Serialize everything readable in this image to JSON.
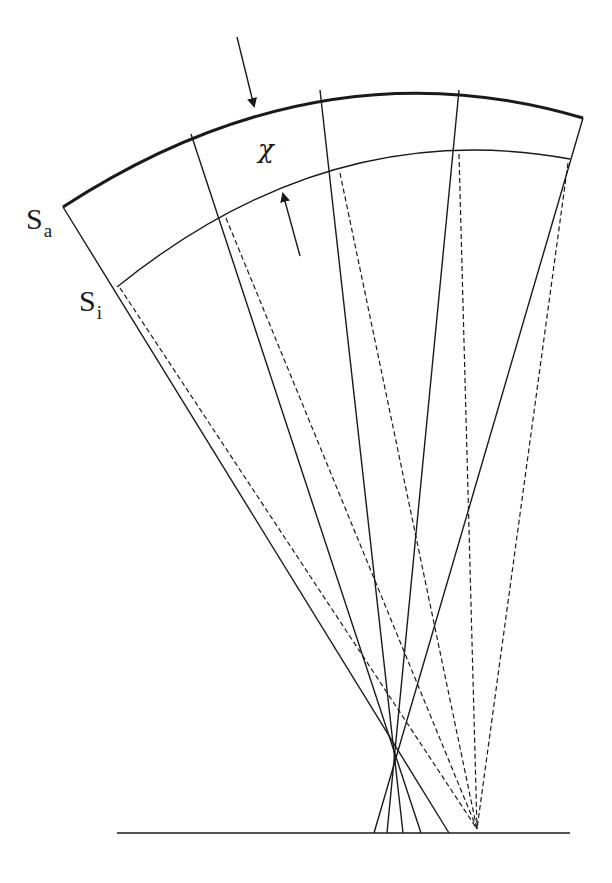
{
  "labels": {
    "outer_surface": {
      "main": "S",
      "sub": "a"
    },
    "inner_surface": {
      "main": "S",
      "sub": "i"
    },
    "thickness": "χ"
  },
  "colors": {
    "stroke": "#1a1a1a",
    "background": "#ffffff"
  },
  "geometry": {
    "outer_arc": {
      "start": [
        63,
        207
      ],
      "end": [
        583,
        118
      ],
      "control": [
        320,
        40
      ],
      "stroke_width": 3
    },
    "inner_arc": {
      "start": [
        117,
        287
      ],
      "end": [
        570,
        159
      ],
      "control": [
        330,
        115
      ],
      "stroke_width": 1.4
    },
    "baseline": {
      "x1": 117,
      "x2": 570,
      "y": 833
    },
    "solid_rays": [
      {
        "from": [
          63,
          207
        ],
        "to": [
          449,
          833
        ]
      },
      {
        "from": [
          191,
          134
        ],
        "to": [
          421,
          833
        ]
      },
      {
        "from": [
          320,
          90
        ],
        "to": [
          403,
          833
        ]
      },
      {
        "from": [
          459,
          90
        ],
        "to": [
          387,
          833
        ]
      },
      {
        "from": [
          583,
          118
        ],
        "to": [
          374,
          833
        ]
      }
    ],
    "dashed_rays": [
      {
        "from": [
          120,
          288
        ],
        "to": [
          477,
          829
        ]
      },
      {
        "from": [
          226,
          218
        ],
        "to": [
          477,
          829
        ]
      },
      {
        "from": [
          340,
          173
        ],
        "to": [
          477,
          829
        ]
      },
      {
        "from": [
          459,
          154
        ],
        "to": [
          477,
          829
        ]
      },
      {
        "from": [
          568,
          163
        ],
        "to": [
          477,
          829
        ]
      }
    ],
    "arrows": [
      {
        "name": "outer-surface-arrow",
        "from": [
          237,
          37
        ],
        "to": [
          254,
          106
        ]
      },
      {
        "name": "inner-surface-arrow",
        "from": [
          300,
          256
        ],
        "to": [
          283,
          194
        ]
      }
    ]
  }
}
